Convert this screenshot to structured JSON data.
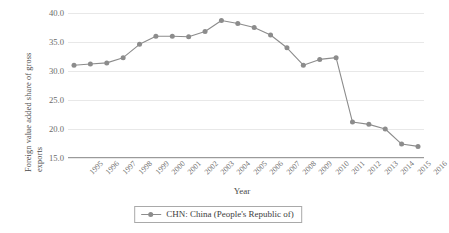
{
  "chart_data": {
    "type": "line",
    "title": "",
    "xlabel": "Year",
    "ylabel": "Foreign value added share of gross\nexports",
    "categories": [
      "1995",
      "1996",
      "1997",
      "1998",
      "1999",
      "2000",
      "2001",
      "2002",
      "2003",
      "2004",
      "2005",
      "2006",
      "2007",
      "2008",
      "2009",
      "2010",
      "2011",
      "2012",
      "2013",
      "2014",
      "2015",
      "2016"
    ],
    "series": [
      {
        "name": "CHN: China (People's Republic of)",
        "color": "#8c8c8c",
        "values": [
          31.0,
          31.2,
          31.4,
          32.3,
          34.6,
          36.0,
          36.0,
          35.9,
          36.8,
          38.7,
          38.2,
          37.5,
          36.2,
          34.0,
          31.0,
          32.0,
          32.3,
          21.2,
          20.8,
          20.0,
          17.4,
          17.0
        ]
      }
    ],
    "ylim": [
      15.0,
      40.0
    ],
    "yticks": [
      "15.0",
      "20.0",
      "25.0",
      "30.0",
      "35.0",
      "40.0"
    ],
    "ytick_values": [
      15.0,
      20.0,
      25.0,
      30.0,
      35.0,
      40.0
    ],
    "grid": true,
    "grid_axis": "y",
    "legend_position": "bottom-center",
    "marker": "circle",
    "background_color": "#ffffff",
    "grid_color": "#e8e8e8",
    "axis_color": "#9a9a9a",
    "text_color": "#5a5a5a"
  },
  "legend": {
    "entries": [
      {
        "label": "CHN: China (People's Republic of)",
        "color": "#8c8c8c"
      }
    ]
  }
}
